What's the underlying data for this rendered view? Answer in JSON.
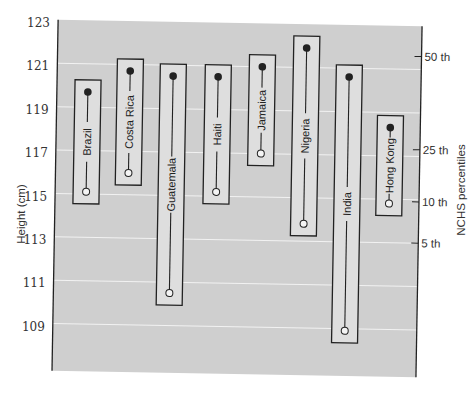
{
  "chart_data": {
    "type": "range-dumbbell",
    "title": "",
    "ylabel": "Height (cm)",
    "ylabel_right": "NCHS percentiles",
    "ylim": [
      107,
      123
    ],
    "yticks": [
      123,
      121,
      119,
      117,
      115,
      113,
      111,
      109
    ],
    "right_ticks": [
      {
        "label": "50 th",
        "value": 121.6
      },
      {
        "label": "25 th",
        "value": 117.3
      },
      {
        "label": "10 th",
        "value": 114.9
      },
      {
        "label": "5 th",
        "value": 113.0
      }
    ],
    "grid": true,
    "categories": [
      "Brazil",
      "Costa Rica",
      "Guatemala",
      "Haiti",
      "Jamaica",
      "Nigeria",
      "India",
      "Hong Kong"
    ],
    "series": [
      {
        "name": "high (filled circle)",
        "values": [
          119.7,
          120.7,
          120.5,
          120.5,
          121.0,
          121.9,
          120.6,
          118.3
        ]
      },
      {
        "name": "low (open circle)",
        "values": [
          115.1,
          116.0,
          110.5,
          115.2,
          117.0,
          113.8,
          108.9,
          114.8
        ]
      }
    ]
  },
  "colors": {
    "panel": "#cfcfcf",
    "box": "#dedede",
    "gridline": "#f2f2f2",
    "ink": "#222222"
  }
}
